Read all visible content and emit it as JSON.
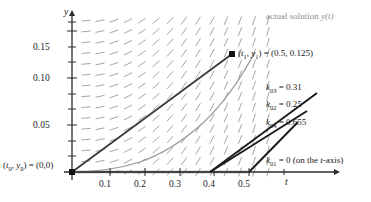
{
  "chart_data": {
    "type": "line",
    "title": "",
    "xlabel": "t",
    "ylabel": "y",
    "xlim": [
      0,
      0.58
    ],
    "ylim": [
      0,
      0.195
    ],
    "grid": false,
    "x_ticks": [
      "0.1",
      "0.2",
      "0.3",
      "0.4",
      "0.5"
    ],
    "x_tick_values": [
      0.1,
      0.2,
      0.3,
      0.4,
      0.5
    ],
    "y_ticks": [
      "0.05",
      "0.10",
      "0.15"
    ],
    "y_tick_values": [
      0.05,
      0.1,
      0.15
    ],
    "background": "slope field of short dashes (direction field)",
    "series": [
      {
        "name": "actual solution y(t)",
        "type": "curve",
        "color": "#9a9a9a",
        "points": [
          [
            0.0,
            0.0
          ],
          [
            0.1,
            0.002
          ],
          [
            0.2,
            0.013
          ],
          [
            0.3,
            0.042
          ],
          [
            0.4,
            0.097
          ],
          [
            0.5,
            0.183
          ]
        ]
      },
      {
        "name": "k01 slope line",
        "type": "segment",
        "color": "#7c7c7c",
        "points": [
          [
            0.0,
            0.0
          ],
          [
            0.5,
            0.0
          ]
        ],
        "label": "k_{01} = 0 (on the t-axis)"
      },
      {
        "name": "k02 slope line",
        "type": "segment",
        "color": "#1a1a1a",
        "points": [
          [
            0.25,
            0.0
          ],
          [
            0.56,
            0.0775
          ]
        ],
        "label": "k_{02} = 0.25"
      },
      {
        "name": "k03 slope line",
        "type": "segment",
        "color": "#1a1a1a",
        "points": [
          [
            0.25,
            0.0
          ],
          [
            0.575,
            0.1008
          ]
        ],
        "label": "k_{03} = 0.31"
      },
      {
        "name": "k04 slope line",
        "type": "segment",
        "color": "#1a1a1a",
        "points": [
          [
            0.5,
            0.0
          ],
          [
            0.595,
            0.0622
          ]
        ],
        "label": "k_{04} = 0.655"
      },
      {
        "name": "Euler step to (t1,y1)",
        "type": "segment",
        "color": "#3a3a3a",
        "points": [
          [
            0.0,
            0.0
          ],
          [
            0.5,
            0.1565
          ]
        ]
      }
    ],
    "annotations": [
      {
        "name": "origin-point",
        "text": "(t0, y0) = (0,0)",
        "at": [
          0.0,
          0.0
        ]
      },
      {
        "name": "endpoint",
        "text": "(t1, y1) = (0.5, 0.125)",
        "at": [
          0.5,
          0.1565
        ]
      },
      {
        "name": "actual-solution",
        "text": "actual solution y(t)",
        "at": [
          0.56,
          0.19
        ]
      }
    ]
  },
  "axes": {
    "y_label": "y",
    "x_label": "t",
    "y_ticks": [
      "0.15",
      "0.10",
      "0.05"
    ],
    "x_ticks": [
      "0.1",
      "0.2",
      "0.3",
      "0.4",
      "0.5"
    ]
  },
  "labels": {
    "actual_solution": "actual solution ",
    "actual_solution_fn": "y(t)",
    "origin_pre": "(",
    "origin_t": "t",
    "origin_t_sub": "0",
    "origin_comma": ", ",
    "origin_y": "y",
    "origin_y_sub": "0",
    "origin_post": ") = (0,0)",
    "point_t": "t",
    "point_t_sub": "1",
    "point_y": "y",
    "point_y_sub": "1",
    "point_value": ") = (0.5, 0.125)",
    "k01_name": "k",
    "k01_sub": "01",
    "k01_value": " = 0 (on the ",
    "k01_axis_var": "t",
    "k01_axis_tail": "-axis)",
    "k02_name": "k",
    "k02_sub": "02",
    "k02_value": " = 0.25",
    "k03_name": "k",
    "k03_sub": "03",
    "k03_value": " = 0.31",
    "k04_name": "k",
    "k04_sub": "04",
    "k04_value": " = 0.655"
  },
  "colors": {
    "axis": "#2b2b2b",
    "slope_field": "#9b9b9b",
    "solution_curve": "#9a9a9a",
    "euler_line": "#3a3a3a",
    "k_line": "#1a1a1a",
    "t_axis_highlight": "#8a8a8a",
    "text": "#1a1a1a",
    "muted_text": "#8d8d8d"
  }
}
